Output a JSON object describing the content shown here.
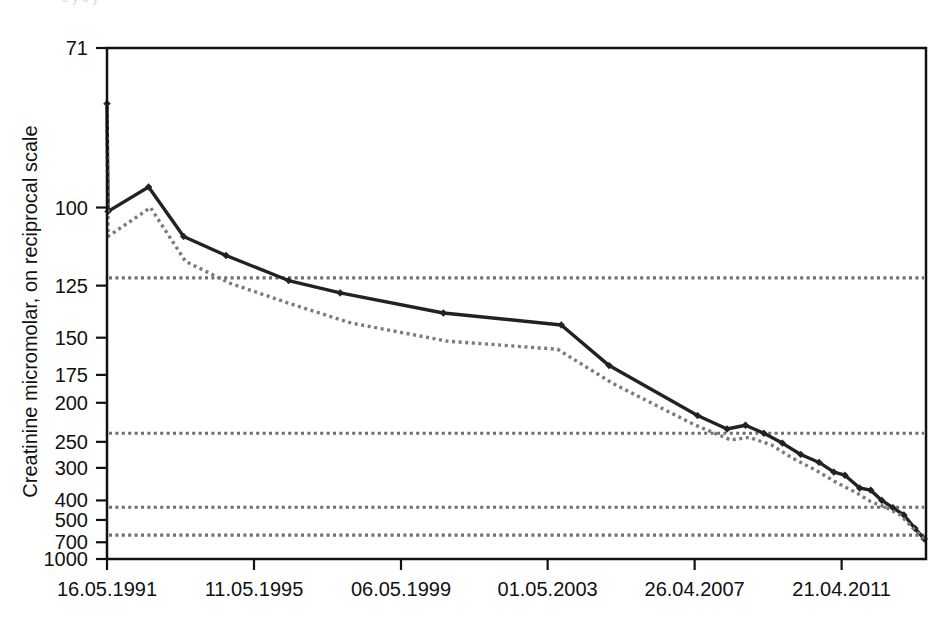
{
  "figure": {
    "cutoff_header_text": "o  y                                                         o                    y",
    "y_axis_title": "Creatinine micromolar, on reciprocal scale"
  },
  "chart_data": {
    "type": "line",
    "title": "",
    "xlabel": "",
    "ylabel": "Creatinine micromolar, on reciprocal scale",
    "y_scale": "reciprocal",
    "grid": false,
    "legend_position": "none",
    "y_ticks": [
      71,
      100,
      125,
      150,
      175,
      200,
      250,
      300,
      400,
      500,
      700,
      1000
    ],
    "y_tick_labels": [
      "71",
      "100",
      "125",
      "150",
      "175",
      "200",
      "250",
      "300",
      "400",
      "500",
      "700",
      "1000"
    ],
    "ylim": [
      71,
      1000
    ],
    "x_tick_labels": [
      "16.05.1991",
      "11.05.1995",
      "06.05.1999",
      "01.05.2003",
      "26.04.2007",
      "21.04.2011"
    ],
    "x_tick_years": [
      1991.37,
      1995.36,
      1999.35,
      2003.33,
      2007.32,
      2011.31
    ],
    "xlim": [
      1991.37,
      2013.6
    ],
    "reference_lines": {
      "style": "dotted",
      "color": "#6e6e6e",
      "values": [
        122,
        237,
        430,
        620
      ]
    },
    "series": [
      {
        "name": "measured creatinine",
        "style": "solid",
        "color": "#222222",
        "marker": "diamond",
        "points": [
          {
            "x": 1991.37,
            "y": 79
          },
          {
            "x": 1991.4,
            "y": 101
          },
          {
            "x": 1992.5,
            "y": 95
          },
          {
            "x": 1993.45,
            "y": 108
          },
          {
            "x": 1994.6,
            "y": 114
          },
          {
            "x": 1996.3,
            "y": 123
          },
          {
            "x": 1997.7,
            "y": 128
          },
          {
            "x": 2000.5,
            "y": 137
          },
          {
            "x": 2003.7,
            "y": 143
          },
          {
            "x": 2005.0,
            "y": 168
          },
          {
            "x": 2007.4,
            "y": 214
          },
          {
            "x": 2008.2,
            "y": 231
          },
          {
            "x": 2008.7,
            "y": 226
          },
          {
            "x": 2009.2,
            "y": 237
          },
          {
            "x": 2009.7,
            "y": 252
          },
          {
            "x": 2010.2,
            "y": 272
          },
          {
            "x": 2010.7,
            "y": 288
          },
          {
            "x": 2011.1,
            "y": 310
          },
          {
            "x": 2011.4,
            "y": 318
          },
          {
            "x": 2011.8,
            "y": 355
          },
          {
            "x": 2012.1,
            "y": 362
          },
          {
            "x": 2012.4,
            "y": 400
          },
          {
            "x": 2012.7,
            "y": 432
          },
          {
            "x": 2013.0,
            "y": 470
          },
          {
            "x": 2013.3,
            "y": 560
          },
          {
            "x": 2013.55,
            "y": 660
          }
        ]
      },
      {
        "name": "fitted / smoothed trend",
        "style": "dotted",
        "color": "#7a7a7a",
        "marker": "none",
        "points": [
          {
            "x": 1991.37,
            "y": 79
          },
          {
            "x": 1991.4,
            "y": 108
          },
          {
            "x": 1992.55,
            "y": 100
          },
          {
            "x": 1993.5,
            "y": 116
          },
          {
            "x": 1994.7,
            "y": 124
          },
          {
            "x": 1996.4,
            "y": 133
          },
          {
            "x": 1998.0,
            "y": 142
          },
          {
            "x": 2000.6,
            "y": 152
          },
          {
            "x": 2003.6,
            "y": 157
          },
          {
            "x": 2005.1,
            "y": 182
          },
          {
            "x": 2007.3,
            "y": 225
          },
          {
            "x": 2008.3,
            "y": 247
          },
          {
            "x": 2008.8,
            "y": 243
          },
          {
            "x": 2009.4,
            "y": 255
          },
          {
            "x": 2010.0,
            "y": 280
          },
          {
            "x": 2010.6,
            "y": 305
          },
          {
            "x": 2011.2,
            "y": 340
          },
          {
            "x": 2011.7,
            "y": 370
          },
          {
            "x": 2012.1,
            "y": 405
          },
          {
            "x": 2012.5,
            "y": 430
          },
          {
            "x": 2012.9,
            "y": 470
          },
          {
            "x": 2013.2,
            "y": 545
          },
          {
            "x": 2013.55,
            "y": 660
          }
        ]
      }
    ]
  }
}
